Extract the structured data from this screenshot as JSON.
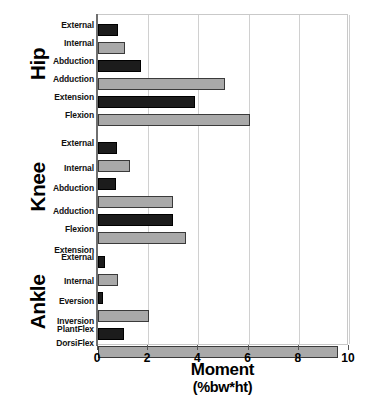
{
  "chart_data": {
    "type": "bar",
    "orientation": "horizontal",
    "title": "",
    "xlabel": "Moment",
    "xlabel_unit": "(%bw*ht)",
    "ylabel": "",
    "xlim": [
      0,
      10
    ],
    "xticks": [
      0,
      2,
      4,
      6,
      8,
      10
    ],
    "xtick_labels": [
      "0",
      "2",
      "4",
      "6",
      "8",
      "10"
    ],
    "grid": true,
    "grid_axis": "x",
    "legend": "none",
    "colors": {
      "dark": "#1c1c1c",
      "light": "#a9a9a9",
      "grid": "#d0d0d0",
      "axis": "#6f6f6f",
      "text": "#000000"
    },
    "groups": [
      {
        "name": "Hip",
        "categories": [
          "External",
          "Internal",
          "Abduction",
          "Adduction",
          "Extension",
          "Flexion"
        ],
        "values": [
          0.78,
          1.08,
          1.7,
          5.05,
          3.85,
          6.05
        ],
        "shades": [
          "dark",
          "light",
          "dark",
          "light",
          "dark",
          "light"
        ]
      },
      {
        "name": "Knee",
        "categories": [
          "External",
          "Internal",
          "Abduction",
          "Adduction",
          "Flexion",
          "Extension"
        ],
        "values": [
          0.76,
          1.27,
          0.72,
          2.98,
          2.98,
          3.52
        ],
        "shades": [
          "dark",
          "light",
          "dark",
          "light",
          "dark",
          "light"
        ]
      },
      {
        "name": "Ankle",
        "categories": [
          "External",
          "Internal",
          "Eversion",
          "Inversion",
          "PlantFlex",
          "DorsiFlex"
        ],
        "values": [
          0.28,
          0.78,
          0.18,
          2.05,
          1.05,
          9.55
        ],
        "shades": [
          "dark",
          "light",
          "dark",
          "light",
          "dark",
          "light"
        ]
      }
    ]
  },
  "group_labels": {
    "hip": "Hip",
    "knee": "Knee",
    "ankle": "Ankle"
  },
  "axis": {
    "title_main": "Moment",
    "title_unit": "(%bw*ht)",
    "tick_0": "0",
    "tick_2": "2",
    "tick_4": "4",
    "tick_6": "6",
    "tick_8": "8",
    "tick_10": "10"
  },
  "categories": {
    "hip": {
      "c0": "External",
      "c1": "Internal",
      "c2": "Abduction",
      "c3": "Adduction",
      "c4": "Extension",
      "c5": "Flexion"
    },
    "knee": {
      "c0": "External",
      "c1": "Internal",
      "c2": "Abduction",
      "c3": "Adduction",
      "c4": "Flexion",
      "c5": "Extension"
    },
    "ankle": {
      "c0": "External",
      "c1": "Internal",
      "c2": "Eversion",
      "c3": "Inversion",
      "c4": "PlantFlex",
      "c5": "DorsiFlex"
    }
  }
}
